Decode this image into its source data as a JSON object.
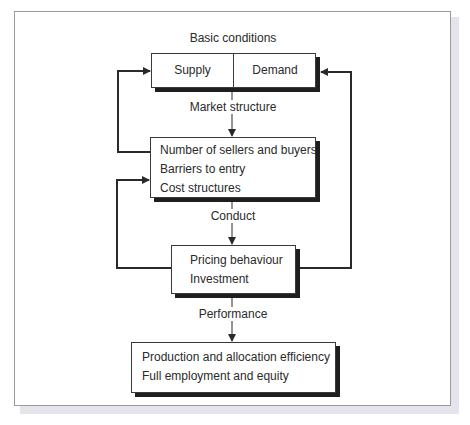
{
  "diagram": {
    "stages": {
      "basic_conditions": {
        "label": "Basic conditions",
        "cells": [
          "Supply",
          "Demand"
        ]
      },
      "market_structure": {
        "label": "Market structure",
        "items": [
          "Number of sellers and buyers",
          "Barriers to entry",
          "Cost structures"
        ]
      },
      "conduct": {
        "label": "Conduct",
        "items": [
          "Pricing behaviour",
          "Investment"
        ]
      },
      "performance": {
        "label": "Performance",
        "items": [
          "Production and allocation efficiency",
          "Full employment and equity"
        ]
      }
    },
    "edges": [
      {
        "from": "basic_conditions",
        "to": "market_structure",
        "type": "arrow-down"
      },
      {
        "from": "market_structure",
        "to": "conduct",
        "type": "arrow-down"
      },
      {
        "from": "conduct",
        "to": "performance",
        "type": "arrow-down"
      },
      {
        "from": "market_structure",
        "to": "basic_conditions",
        "type": "feedback-left"
      },
      {
        "from": "conduct",
        "to": "market_structure",
        "type": "feedback-left"
      },
      {
        "from": "conduct",
        "to": "basic_conditions",
        "type": "feedback-right"
      }
    ],
    "colors": {
      "line": "#2a2a2a",
      "box_border": "#3a3a3a",
      "box_shadow": "#1e1e1e",
      "frame_border": "#9a9a9a",
      "background": "#ffffff"
    }
  }
}
